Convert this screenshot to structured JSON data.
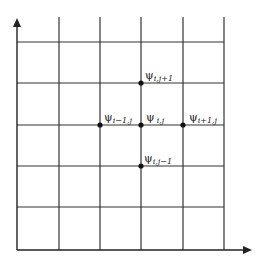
{
  "diagram": {
    "line_color": "#333333",
    "point_color": "#111111",
    "grid": {
      "x_lines": [
        17,
        59,
        100,
        141,
        183,
        224
      ],
      "y_lines": [
        42,
        83,
        125,
        166,
        207,
        250
      ]
    },
    "axes": {
      "x_axis_arrow": "right-arrow",
      "y_axis_arrow": "up-arrow"
    },
    "points": [
      {
        "id": "center",
        "symbol": "ψ",
        "subscript": "i,j"
      },
      {
        "id": "left",
        "symbol": "ψ",
        "subscript": "i−1,j"
      },
      {
        "id": "right",
        "symbol": "ψ",
        "subscript": "i+1,j"
      },
      {
        "id": "top",
        "symbol": "ψ",
        "subscript": "i,j+1"
      },
      {
        "id": "bottom",
        "symbol": "ψ",
        "subscript": "i,j−1"
      }
    ]
  }
}
